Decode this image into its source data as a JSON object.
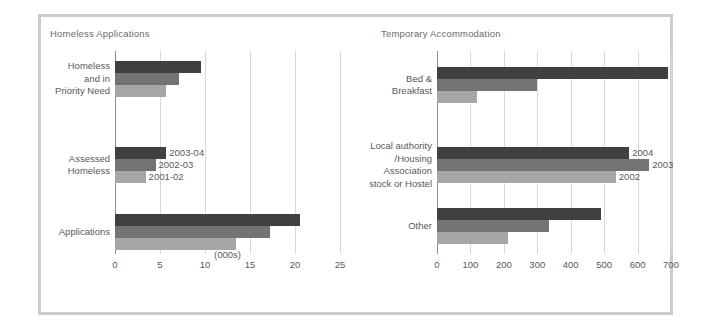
{
  "figure": {
    "border_color": "#cccccc",
    "background": "#ffffff"
  },
  "series_colors": [
    "#404040",
    "#737373",
    "#a6a6a6"
  ],
  "panels": {
    "left": {
      "title": "Homeless Applications",
      "axis_caption": "(000s)",
      "tick_labels": [
        "0",
        "5",
        "10",
        "15",
        "20",
        "25"
      ],
      "legend": [
        "2003-04",
        "2002-03",
        "2001-02"
      ],
      "groups": [
        {
          "label_lines": [
            "Homeless",
            "and in",
            "Priority Need"
          ]
        },
        {
          "label_lines": [
            "Assessed",
            "Homeless"
          ]
        },
        {
          "label_lines": [
            "Applications"
          ]
        }
      ]
    },
    "right": {
      "title": "Temporary Accommodation",
      "axis_caption": "",
      "tick_labels": [
        "0",
        "100",
        "200",
        "300",
        "400",
        "500",
        "600",
        "700"
      ],
      "legend": [
        "2004",
        "2003",
        "2002"
      ],
      "groups": [
        {
          "label_lines": [
            "Bed &",
            "Breakfast"
          ]
        },
        {
          "label_lines": [
            "Local authority",
            "/Housing",
            "Association",
            "stock or Hostel"
          ]
        },
        {
          "label_lines": [
            "Other"
          ]
        }
      ]
    }
  },
  "chart_data": [
    {
      "type": "bar",
      "orientation": "horizontal",
      "title": "Homeless Applications",
      "xlabel": "(000s)",
      "ylabel": "",
      "xlim": [
        0,
        25
      ],
      "xticks": [
        0,
        5,
        10,
        15,
        20,
        25
      ],
      "grid": true,
      "legend_position": "inline-right-of-bars",
      "categories": [
        "Homeless and in Priority Need",
        "Assessed Homeless",
        "Applications"
      ],
      "series": [
        {
          "name": "2003-04",
          "color": "#404040",
          "values": [
            9.5,
            5.7,
            20.6
          ]
        },
        {
          "name": "2002-03",
          "color": "#737373",
          "values": [
            7.1,
            4.5,
            17.2
          ]
        },
        {
          "name": "2001-02",
          "color": "#a6a6a6",
          "values": [
            5.7,
            3.4,
            13.4
          ]
        }
      ]
    },
    {
      "type": "bar",
      "orientation": "horizontal",
      "title": "Temporary Accommodation",
      "xlabel": "",
      "ylabel": "",
      "xlim": [
        0,
        700
      ],
      "xticks": [
        0,
        100,
        200,
        300,
        400,
        500,
        600,
        700
      ],
      "grid": true,
      "legend_position": "inline-right-of-bars",
      "categories": [
        "Bed & Breakfast",
        "Local authority /Housing Association stock or Hostel",
        "Other"
      ],
      "series": [
        {
          "name": "2004",
          "color": "#404040",
          "values": [
            690,
            575,
            490
          ]
        },
        {
          "name": "2003",
          "color": "#737373",
          "values": [
            300,
            635,
            335
          ]
        },
        {
          "name": "2002",
          "color": "#a6a6a6",
          "values": [
            120,
            535,
            213
          ]
        }
      ]
    }
  ]
}
